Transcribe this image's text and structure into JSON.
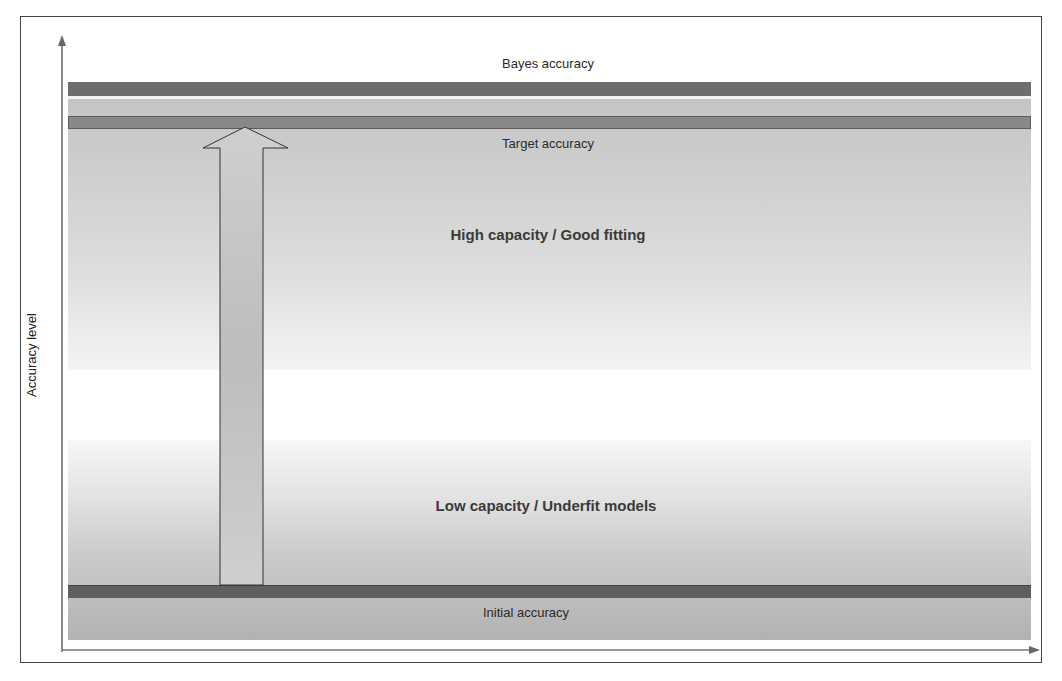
{
  "diagram": {
    "y_axis_label": "Accuracy level",
    "levels": {
      "bayes": {
        "label": "Bayes accuracy",
        "color": "#6d6d6d"
      },
      "target": {
        "label": "Target accuracy",
        "color": "#888888"
      },
      "initial": {
        "label": "Initial accuracy",
        "color": "#5f5f5f"
      }
    },
    "regions": {
      "high": {
        "label": "High capacity / Good fitting"
      },
      "low": {
        "label": "Low capacity / Underfit models"
      }
    },
    "arrow": {
      "direction": "up",
      "from": "initial",
      "to": "target"
    },
    "colors": {
      "frame": "#444444",
      "axis": "#666666",
      "arrow_fill": "#c8c8c8",
      "arrow_stroke": "#333333"
    }
  }
}
